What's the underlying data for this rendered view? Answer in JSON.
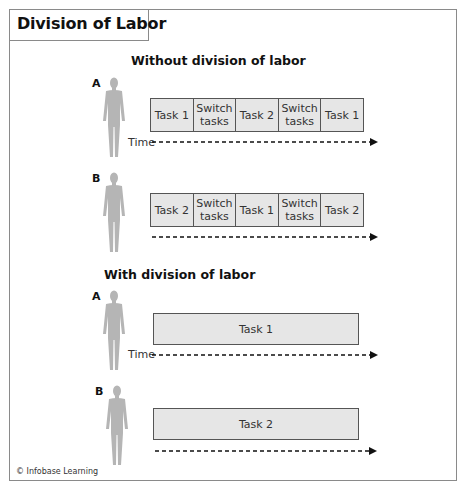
{
  "title": "Division of Labor",
  "credit": "© Infobase Learning",
  "colors": {
    "frame": "#8a8a8a",
    "bar_fill": "#e6e6e6",
    "bar_border": "#555555",
    "person": "#b5b5b5"
  },
  "sections": [
    {
      "heading": "Without division of labor",
      "workers": [
        {
          "label": "A",
          "time_label": "Time",
          "tasks": [
            "Task 1",
            "Switch tasks",
            "Task 2",
            "Switch tasks",
            "Task 1"
          ]
        },
        {
          "label": "B",
          "time_label": "",
          "tasks": [
            "Task 2",
            "Switch tasks",
            "Task 1",
            "Switch tasks",
            "Task 2"
          ]
        }
      ]
    },
    {
      "heading": "With division of labor",
      "workers": [
        {
          "label": "A",
          "time_label": "Time",
          "tasks": [
            "Task 1"
          ]
        },
        {
          "label": "B",
          "time_label": "",
          "tasks": [
            "Task 2"
          ]
        }
      ]
    }
  ]
}
